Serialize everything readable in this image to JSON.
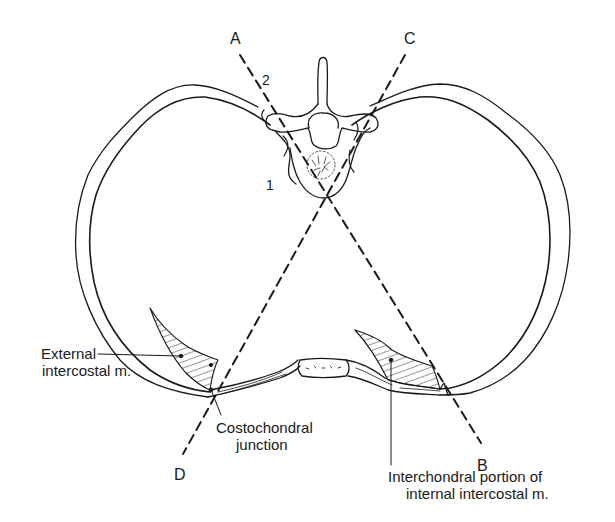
{
  "figure": {
    "type": "anatomical cross-section of thorax",
    "line_color": "#1a1a1a",
    "background": "#ffffff"
  },
  "planes": {
    "a": "A",
    "b": "B",
    "c": "C",
    "d": "D"
  },
  "numbers": {
    "one": "1",
    "two": "2"
  },
  "labels": {
    "external_intercostal": {
      "line1": "External",
      "line2": "intercostal m."
    },
    "costochondral": {
      "line1": "Costochondral",
      "line2": "junction"
    },
    "interchondral": {
      "line1": "Interchondral portion of",
      "line2": "internal intercostal m."
    }
  }
}
